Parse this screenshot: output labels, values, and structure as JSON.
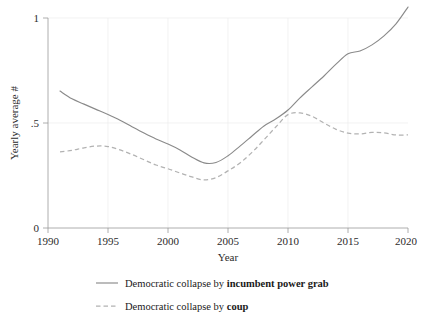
{
  "chart_data": {
    "type": "line",
    "title": "",
    "xlabel": "Year",
    "ylabel": "Yearly average #",
    "xlim": [
      1990,
      2020
    ],
    "ylim": [
      0,
      1.05
    ],
    "grid": true,
    "legend_position": "bottom",
    "x_ticks": [
      "1990",
      "1995",
      "2000",
      "2005",
      "2010",
      "2015",
      "2020"
    ],
    "y_ticks": [
      "0",
      ".5",
      "1"
    ],
    "x": [
      1991,
      1992,
      1993,
      1994,
      1995,
      1996,
      1997,
      1998,
      1999,
      2000,
      2001,
      2002,
      2003,
      2004,
      2005,
      2006,
      2007,
      2008,
      2009,
      2010,
      2011,
      2012,
      2013,
      2014,
      2015,
      2016,
      2017,
      2018,
      2019,
      2020
    ],
    "series": [
      {
        "name": "Democratic collapse by incumbent power grab",
        "style": "solid",
        "color": "#8a8a8a",
        "values": [
          0.652,
          0.615,
          0.59,
          0.565,
          0.54,
          0.513,
          0.482,
          0.452,
          0.424,
          0.4,
          0.372,
          0.337,
          0.31,
          0.312,
          0.344,
          0.39,
          0.438,
          0.486,
          0.52,
          0.562,
          0.62,
          0.672,
          0.724,
          0.78,
          0.83,
          0.843,
          0.872,
          0.915,
          0.972,
          1.052
        ]
      },
      {
        "name": "Democratic collapse by coup",
        "style": "dashed",
        "color": "#b2b2b2",
        "values": [
          0.362,
          0.37,
          0.382,
          0.39,
          0.388,
          0.372,
          0.35,
          0.325,
          0.3,
          0.282,
          0.262,
          0.243,
          0.229,
          0.24,
          0.272,
          0.31,
          0.36,
          0.42,
          0.482,
          0.54,
          0.548,
          0.532,
          0.5,
          0.47,
          0.452,
          0.448,
          0.455,
          0.453,
          0.443,
          0.443
        ]
      }
    ]
  },
  "legend": {
    "items": [
      {
        "prefix": "Democratic collapse by ",
        "emphasis": "incumbent power grab",
        "style": "solid"
      },
      {
        "prefix": "Democratic collapse by ",
        "emphasis": "coup",
        "style": "dashed"
      }
    ]
  },
  "axes": {
    "x_title": "Year",
    "y_title": "Yearly average #",
    "x_tick_labels": [
      "1990",
      "1995",
      "2000",
      "2005",
      "2010",
      "2015",
      "2020"
    ],
    "y_tick_labels": [
      "1",
      ".5",
      "0"
    ]
  },
  "colors": {
    "solid_series": "#8a8a8a",
    "dashed_series": "#b2b2b2",
    "axis": "#9a9a9a",
    "grid": "#ececec",
    "text": "#1a1a1a",
    "background": "#ffffff"
  }
}
